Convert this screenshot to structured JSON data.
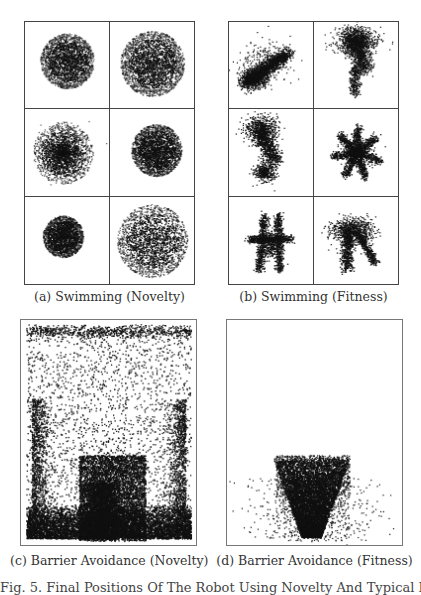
{
  "figure": {
    "subfigures": [
      {
        "id": "a",
        "caption": "(a) Swimming (Novelty)"
      },
      {
        "id": "b",
        "caption": "(b) Swimming (Fitness)"
      },
      {
        "id": "c",
        "caption": "(c) Barrier Avoidance (Novelty)"
      },
      {
        "id": "d",
        "caption": "(d) Barrier Avoidance (Fitness)"
      }
    ],
    "figure_caption_fragment": "Fig. 5. Final Positions Of The Robot Using Novelty And Typical Runs (Fitness)"
  },
  "colors": {
    "ink": "#111111",
    "border": "#444444",
    "background": "#ffffff"
  },
  "chart_data": [
    {
      "type": "scatter",
      "title": "(a) Swimming (Novelty)",
      "layout": "grid 3x2",
      "cells": [
        {
          "shape": "blob",
          "cx": 0.5,
          "cy": 0.45,
          "r": 0.32,
          "density": 0.9
        },
        {
          "shape": "blob",
          "cx": 0.5,
          "cy": 0.48,
          "r": 0.38,
          "density": 1.0
        },
        {
          "shape": "blob-diffuse",
          "cx": 0.45,
          "cy": 0.5,
          "r": 0.36,
          "density": 0.6
        },
        {
          "shape": "blob",
          "cx": 0.55,
          "cy": 0.47,
          "r": 0.3,
          "density": 1.0
        },
        {
          "shape": "blob",
          "cx": 0.45,
          "cy": 0.45,
          "r": 0.24,
          "density": 0.9
        },
        {
          "shape": "blob",
          "cx": 0.5,
          "cy": 0.5,
          "r": 0.42,
          "density": 0.8
        }
      ]
    },
    {
      "type": "scatter",
      "title": "(b) Swimming (Fitness)",
      "layout": "grid 3x2",
      "cells": [
        {
          "shape": "diagonal-streak",
          "cx": 0.4,
          "cy": 0.6
        },
        {
          "shape": "vertical-cluster",
          "cx": 0.55,
          "cy": 0.4
        },
        {
          "shape": "curved-cluster",
          "cx": 0.45,
          "cy": 0.45
        },
        {
          "shape": "star",
          "cx": 0.5,
          "cy": 0.5
        },
        {
          "shape": "cross-star",
          "cx": 0.5,
          "cy": 0.5
        },
        {
          "shape": "fork",
          "cx": 0.5,
          "cy": 0.5
        }
      ]
    },
    {
      "type": "scatter",
      "title": "(c) Barrier Avoidance (Novelty)",
      "description": "Points spread over entire arena; dense band along bottom and a dense rectangular region around the barrier in the lower-center."
    },
    {
      "type": "scatter",
      "title": "(d) Barrier Avoidance (Fitness)",
      "description": "Points concentrated in an inverted triangular/funnel shape beneath the barrier in the lower-center; almost empty elsewhere."
    }
  ]
}
